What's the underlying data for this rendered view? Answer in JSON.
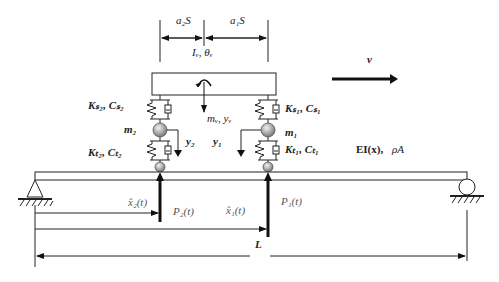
{
  "diagram": {
    "type": "vehicle-bridge interaction model",
    "dimensions": {
      "a2S": "a₂S",
      "a1S": "a₁S"
    },
    "body": {
      "inertia_label": "Iᵥ, θᵥ",
      "mass_label": "mᵥ, yᵥ"
    },
    "velocity_label": "v",
    "left_axle": {
      "suspension_label": "Kₛ₂, Cₛ₂",
      "mass_label": "m₂",
      "disp_label": "y₂",
      "tire_label": "Kₜ₂, Cₜ₂",
      "force_label": "P₂(t)",
      "position_label": "x̂₂(t)"
    },
    "right_axle": {
      "suspension_label": "Kₛ₁, Cₛ₁",
      "mass_label": "m₁",
      "disp_label": "y₁",
      "tire_label": "Kₜ₁, Cₜ₁",
      "force_label": "P₁(t)",
      "position_label": "x̂₁(t)"
    },
    "beam_label_ei": "EI(x),",
    "beam_label_rho": "ρA",
    "span_label": "L"
  }
}
